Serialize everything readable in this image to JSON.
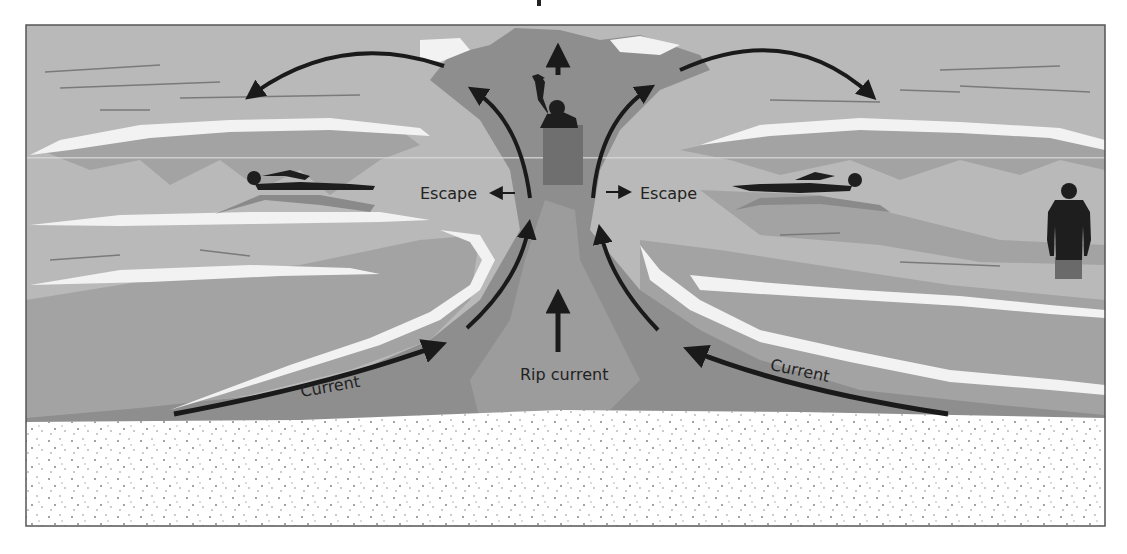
{
  "diagram": {
    "labels": {
      "escape_left": "Escape",
      "escape_right": "Escape",
      "current_left": "Current",
      "current_right": "Current",
      "rip_current": "Rip current"
    },
    "figures": [
      {
        "name": "swimmer-waving",
        "description": "swimmer in rip current waving for help"
      },
      {
        "name": "swimmer-left",
        "description": "swimmer escaping parallel to shore, left"
      },
      {
        "name": "swimmer-right",
        "description": "swimmer escaping parallel to shore, right"
      },
      {
        "name": "person-standing",
        "description": "person standing in shallow water, right"
      }
    ],
    "arrows": [
      {
        "name": "feeder-current-left",
        "direction": "toward rip channel"
      },
      {
        "name": "feeder-current-right",
        "direction": "toward rip channel"
      },
      {
        "name": "rip-current-arrow",
        "direction": "seaward"
      },
      {
        "name": "rip-neck-left",
        "direction": "seaward then curving left"
      },
      {
        "name": "rip-neck-right",
        "direction": "seaward then curving right"
      },
      {
        "name": "escape-left-arrow",
        "direction": "left, parallel to shore"
      },
      {
        "name": "escape-right-arrow",
        "direction": "right, parallel to shore"
      },
      {
        "name": "swimmer-up-arrow",
        "direction": "seaward"
      }
    ],
    "colors": {
      "sea_light": "#b9b9b9",
      "sea_mid": "#a3a3a3",
      "rip_dark": "#8e8e8e",
      "foam": "#f2f2f2",
      "sand": "#ffffff",
      "ink": "#1a1a1a",
      "frame": "#555555"
    }
  }
}
